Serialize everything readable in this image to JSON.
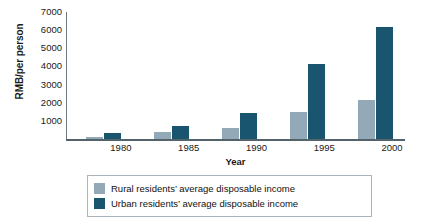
{
  "chart_data": {
    "type": "bar",
    "title": "",
    "xlabel": "Year",
    "ylabel": "RMB/per person",
    "categories": [
      "1980",
      "1985",
      "1990",
      "1995",
      "2000"
    ],
    "ylim": [
      0,
      7000
    ],
    "yticks": [
      1000,
      2000,
      3000,
      4000,
      5000,
      6000,
      7000
    ],
    "ytick_labels": [
      "1000",
      "2000",
      "3000",
      "4000",
      "5000",
      "6000",
      "7000"
    ],
    "grid": false,
    "legend_position": "bottom",
    "series": [
      {
        "name": "Rural residents' average disposable income",
        "color": "#93a9b8",
        "values": [
          130,
          400,
          630,
          1500,
          2150
        ]
      },
      {
        "name": "Urban residents' average disposable income",
        "color": "#1a5570",
        "values": [
          340,
          690,
          1450,
          4150,
          6200
        ]
      }
    ]
  },
  "legend": {
    "items": [
      {
        "label": "Rural residents’ average disposable income"
      },
      {
        "label": "Urban residents’ average disposable income"
      }
    ]
  }
}
